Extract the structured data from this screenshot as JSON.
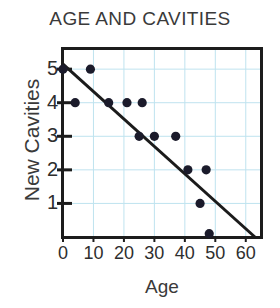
{
  "chart_data": {
    "type": "scatter",
    "title": "AGE AND CAVITIES",
    "xlabel": "Age",
    "ylabel": "New Cavities",
    "xlim": [
      0,
      65
    ],
    "ylim": [
      0,
      5.6
    ],
    "grid": true,
    "grid_color": "#bfe3ef",
    "legend": null,
    "xticks": [
      0,
      10,
      20,
      30,
      40,
      50,
      60
    ],
    "xtick_labels": [
      "0",
      "10",
      "20",
      "30",
      "40",
      "50",
      "60"
    ],
    "yticks": [
      1,
      2,
      3,
      4,
      5
    ],
    "ytick_labels": [
      "1",
      "2",
      "3",
      "4",
      "5"
    ],
    "point_color": "#1b1b2b",
    "line_color": "#1b1b1b",
    "points": [
      {
        "x": 0,
        "y": 5
      },
      {
        "x": 9,
        "y": 5
      },
      {
        "x": 4,
        "y": 4
      },
      {
        "x": 15,
        "y": 4
      },
      {
        "x": 21,
        "y": 4
      },
      {
        "x": 26,
        "y": 4
      },
      {
        "x": 25,
        "y": 3
      },
      {
        "x": 30,
        "y": 3
      },
      {
        "x": 37,
        "y": 3
      },
      {
        "x": 41,
        "y": 2
      },
      {
        "x": 47,
        "y": 2
      },
      {
        "x": 45,
        "y": 1
      },
      {
        "x": 48,
        "y": 0.1
      }
    ],
    "trendline": {
      "x0": 0,
      "y0": 5.15,
      "x1": 63,
      "y1": 0.0
    }
  }
}
